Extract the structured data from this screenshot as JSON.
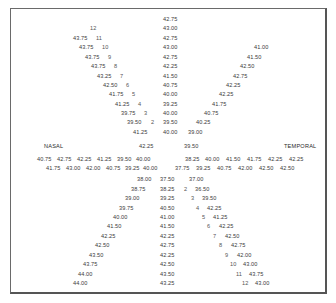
{
  "labels": {
    "nasal": "NASAL",
    "temporal": "TEMPORAL"
  },
  "center_top": [
    "42.75",
    "43.00",
    "42.75",
    "43.00",
    "42.75",
    "42.25",
    "41.50",
    "40.75",
    "40.00",
    "39.25",
    "40.00",
    "39.50",
    "40.00"
  ],
  "upper_left_diagonal": [
    {
      "idx": "12",
      "value": ""
    },
    {
      "idx": "11",
      "value": "43.75"
    },
    {
      "idx": "10",
      "value": "43.75"
    },
    {
      "idx": "9",
      "value": "43.75"
    },
    {
      "idx": "8",
      "value": "43.75"
    },
    {
      "idx": "7",
      "value": "43.25"
    },
    {
      "idx": "6",
      "value": "42.50"
    },
    {
      "idx": "5",
      "value": "41.75"
    },
    {
      "idx": "4",
      "value": "41.25"
    },
    {
      "idx": "3",
      "value": "39.75"
    },
    {
      "idx": "2",
      "value": "39.50"
    },
    {
      "idx": "",
      "value": "41.25"
    }
  ],
  "upper_right_diagonal": [
    "41.00",
    "41.50",
    "42.50",
    "42.75",
    "42.25",
    "42.25",
    "41.75",
    "40.75",
    "40.25",
    "39.00"
  ],
  "horizontal": {
    "center_left": "42.25",
    "center_right": "39.50",
    "nasal_row1": [
      "40.75",
      "42.75",
      "42.25",
      "41.25",
      "39.50",
      "40.00"
    ],
    "nasal_row2": [
      "41.75",
      "43.00",
      "42.00",
      "40.75",
      "39.25",
      "40.00"
    ],
    "temporal_row1": [
      "38.25",
      "40.00",
      "41.50",
      "41.75",
      "42.25",
      "42.25"
    ],
    "temporal_row2": [
      "37.75",
      "39.25",
      "40.75",
      "42.00",
      "42.50",
      "42.50"
    ]
  },
  "lower_left_diagonal": [
    "38.00",
    "38.75",
    "39.00",
    "39.75",
    "40.00",
    "41.50",
    "42.25",
    "42.50",
    "43.50",
    "43.75",
    "44.00",
    "44.00"
  ],
  "center_bottom": [
    "37.50",
    "38.25",
    "39.25",
    "40.50",
    "41.00",
    "41.50",
    "42.25",
    "42.75",
    "42.25",
    "42.50",
    "43.50",
    "43.25"
  ],
  "lower_right_diagonal": [
    {
      "idx": "",
      "value": "37.00"
    },
    {
      "idx": "2",
      "value": "36.50"
    },
    {
      "idx": "3",
      "value": "39.50"
    },
    {
      "idx": "4",
      "value": "42.25"
    },
    {
      "idx": "5",
      "value": "41.25"
    },
    {
      "idx": "6",
      "value": "42.25"
    },
    {
      "idx": "7",
      "value": "42.50"
    },
    {
      "idx": "8",
      "value": "42.75"
    },
    {
      "idx": "9",
      "value": "42.00"
    },
    {
      "idx": "10",
      "value": "43.00"
    },
    {
      "idx": "11",
      "value": "43.75"
    },
    {
      "idx": "12",
      "value": "43.00"
    }
  ]
}
